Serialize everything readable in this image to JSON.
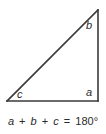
{
  "figure": {
    "type": "geometry-diagram",
    "background_color": "#ffffff",
    "stroke_color": "#3a3a3a",
    "text_color": "#2b2b2b"
  },
  "triangle": {
    "shape": "right-triangle",
    "vertices": {
      "bottom_left": {
        "x": 7,
        "y": 101
      },
      "bottom_right": {
        "x": 98,
        "y": 101
      },
      "top_right": {
        "x": 98,
        "y": 10
      }
    },
    "edges": [
      {
        "name": "base",
        "from": "bottom_left",
        "to": "bottom_right"
      },
      {
        "name": "vertical-leg",
        "from": "bottom_right",
        "to": "top_right"
      },
      {
        "name": "hypotenuse",
        "from": "top_right",
        "to": "bottom_left"
      }
    ],
    "angle_labels": [
      {
        "id": "a",
        "text": "a",
        "vertex": "bottom_right",
        "note": "right angle"
      },
      {
        "id": "b",
        "text": "b",
        "vertex": "top_right"
      },
      {
        "id": "c",
        "text": "c",
        "vertex": "bottom_left"
      }
    ]
  },
  "equation": {
    "full_text": "a + b + c = 180°",
    "terms": {
      "a": "a",
      "b": "b",
      "c": "c",
      "plus": "+",
      "equals": "=",
      "value": "180",
      "degree": "°"
    }
  }
}
